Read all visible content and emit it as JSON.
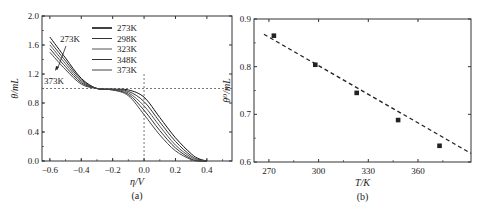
{
  "chart_data": [
    {
      "id": "a",
      "type": "line",
      "caption": "(a)",
      "xlabel": "η/V",
      "ylabel": "θ/mL",
      "xlim": [
        -0.65,
        0.56
      ],
      "ylim": [
        0.0,
        2.0
      ],
      "xticks": [
        "-0.6",
        "-0.4",
        "-0.2",
        "0.0",
        "0.2",
        "0.4"
      ],
      "yticks": [
        "0.0",
        "0.4",
        "0.8",
        "1.2",
        "1.6",
        "2.0"
      ],
      "grid": false,
      "legend_position": "upper center",
      "reference_lines": {
        "horizontal_y": 1.0,
        "vertical_x": 0.0,
        "style": "dashed"
      },
      "annotations": [
        {
          "text": "273K",
          "x": -0.52,
          "y": 1.62
        },
        {
          "text": "373K",
          "x": -0.6,
          "y": 1.15
        }
      ],
      "x": [
        -0.6,
        -0.5,
        -0.4,
        -0.3,
        -0.2,
        -0.1,
        0.0,
        0.1,
        0.2,
        0.3,
        0.35,
        0.4
      ],
      "series": [
        {
          "name": "273K",
          "color": "#111111",
          "values": [
            1.71,
            1.42,
            1.14,
            1.0,
            0.99,
            0.98,
            0.88,
            0.6,
            0.32,
            0.1,
            0.03,
            0.0
          ]
        },
        {
          "name": "298K",
          "color": "#333333",
          "values": [
            1.65,
            1.38,
            1.12,
            1.0,
            0.99,
            0.96,
            0.82,
            0.54,
            0.27,
            0.07,
            0.02,
            0.0
          ]
        },
        {
          "name": "323K",
          "color": "#555555",
          "values": [
            1.6,
            1.34,
            1.1,
            1.0,
            0.99,
            0.94,
            0.76,
            0.48,
            0.22,
            0.05,
            0.01,
            0.0
          ]
        },
        {
          "name": "348K",
          "color": "#333333",
          "values": [
            1.55,
            1.3,
            1.08,
            1.0,
            0.98,
            0.92,
            0.7,
            0.42,
            0.18,
            0.03,
            0.0,
            0.0
          ]
        },
        {
          "name": "373K",
          "color": "#444444",
          "values": [
            1.5,
            1.26,
            1.06,
            1.0,
            0.98,
            0.9,
            0.64,
            0.36,
            0.14,
            0.02,
            0.0,
            0.0
          ]
        }
      ]
    },
    {
      "id": "b",
      "type": "scatter",
      "caption": "(b)",
      "xlabel": "T/K",
      "ylabel": "θ⁰/mL",
      "xlim": [
        261,
        392
      ],
      "ylim": [
        0.6,
        0.9
      ],
      "xticks": [
        "270",
        "300",
        "330",
        "360"
      ],
      "yticks": [
        "0.6",
        "0.7",
        "0.8",
        "0.9"
      ],
      "grid": false,
      "x": [
        273,
        298,
        323,
        348,
        373
      ],
      "series": [
        {
          "name": "θ⁰",
          "marker": "square",
          "color": "#222222",
          "values": [
            0.865,
            0.804,
            0.745,
            0.688,
            0.634
          ]
        }
      ],
      "fit_line": {
        "style": "dashed",
        "x": [
          267,
          392
        ],
        "y": [
          0.868,
          0.618
        ]
      }
    }
  ]
}
